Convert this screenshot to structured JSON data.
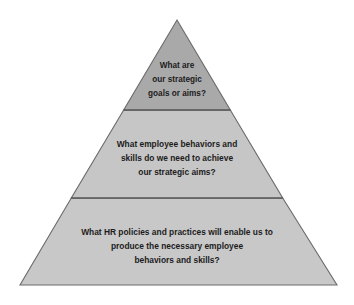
{
  "figure": {
    "name": "hr-strategy-pyramid",
    "background_color": "#ffffff",
    "outline_color": "#6b6b6b",
    "divider_color": "#4a4a4a",
    "text_color": "#1c1c1c"
  },
  "pyramid": {
    "apex": {
      "x": 177,
      "y": 20
    },
    "base_left": {
      "x": 20,
      "y": 285
    },
    "base_right": {
      "x": 337,
      "y": 285
    },
    "divider_1_y": 110,
    "divider_2_y": 198,
    "tiers": [
      {
        "id": "tier-top",
        "fill": "#a9a9a9",
        "lines": [
          "What are",
          "our strategic",
          "goals or aims?"
        ]
      },
      {
        "id": "tier-middle",
        "fill": "#c6c6c6",
        "lines": [
          "What employee behaviors and",
          "skills do we need to achieve",
          "our strategic aims?"
        ]
      },
      {
        "id": "tier-bottom",
        "fill": "#c8c8c8",
        "lines": [
          "What HR policies and practices will enable us to",
          "produce the necessary employee",
          "behaviors and skills?"
        ]
      }
    ]
  }
}
